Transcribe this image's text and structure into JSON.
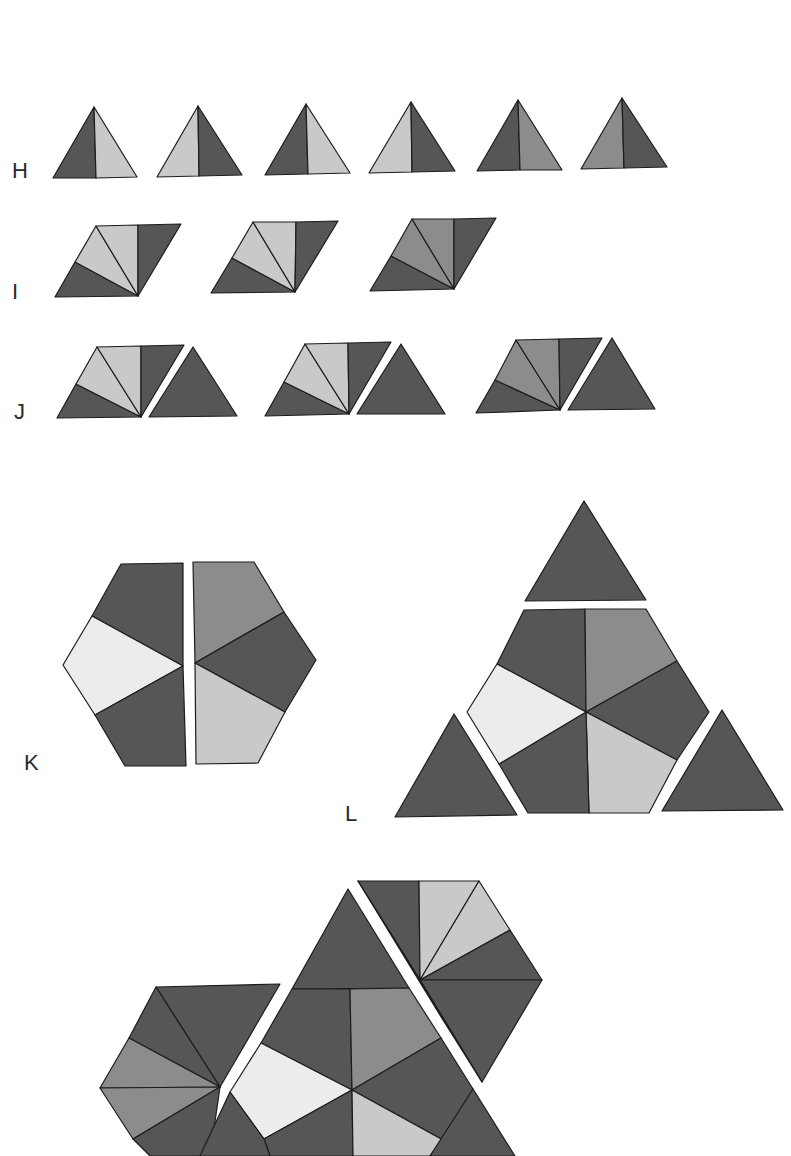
{
  "colors": {
    "dark": "#565656",
    "mid": "#8c8c8c",
    "light": "#c9c9c9",
    "pale": "#ececec",
    "stroke": "#1c1c1c"
  },
  "labels": [
    {
      "text": "H",
      "x": 12,
      "y": 160
    },
    {
      "text": "I",
      "x": 12,
      "y": 281
    },
    {
      "text": "J",
      "x": 14,
      "y": 401
    },
    {
      "text": "K",
      "x": 24,
      "y": 752
    },
    {
      "text": "L",
      "x": 345,
      "y": 803
    }
  ],
  "rows": {
    "H": {
      "label": "H",
      "shapes": [
        {
          "polys": [
            {
              "pts": "53,178 94,107 96,178",
              "fill": "dark"
            },
            {
              "pts": "94,107 96,178 137,177",
              "fill": "light"
            }
          ]
        },
        {
          "polys": [
            {
              "pts": "157,177 198,106 199,176",
              "fill": "light"
            },
            {
              "pts": "198,106 199,176 242,175",
              "fill": "dark"
            }
          ]
        },
        {
          "polys": [
            {
              "pts": "265,175 306,104 308,174",
              "fill": "dark"
            },
            {
              "pts": "306,104 308,174 350,173",
              "fill": "light"
            }
          ]
        },
        {
          "polys": [
            {
              "pts": "369,173 411,102 412,172",
              "fill": "light"
            },
            {
              "pts": "411,102 412,172 455,171",
              "fill": "dark"
            }
          ]
        },
        {
          "polys": [
            {
              "pts": "477,171 518,100 520,170",
              "fill": "dark"
            },
            {
              "pts": "518,100 520,170 562,170",
              "fill": "mid"
            }
          ]
        },
        {
          "polys": [
            {
              "pts": "581,169 622,98 624,168",
              "fill": "mid"
            },
            {
              "pts": "622,98 624,168 667,167",
              "fill": "dark"
            }
          ]
        }
      ]
    },
    "I": {
      "label": "I",
      "shapes": [
        {
          "polys": [
            {
              "pts": "55,297 75,262 138,296",
              "fill": "dark"
            },
            {
              "pts": "75,262 96,226 138,296",
              "fill": "light"
            },
            {
              "pts": "96,226 138,225 138,296",
              "fill": "light"
            },
            {
              "pts": "138,225 181,224 138,296",
              "fill": "dark"
            }
          ]
        },
        {
          "polys": [
            {
              "pts": "211,293 232,258 295,292",
              "fill": "dark"
            },
            {
              "pts": "232,258 253,222 295,292",
              "fill": "light"
            },
            {
              "pts": "253,222 296,222 295,292",
              "fill": "light"
            },
            {
              "pts": "296,222 338,221 295,292",
              "fill": "dark"
            }
          ]
        },
        {
          "polys": [
            {
              "pts": "370,291 391,256 454,289",
              "fill": "dark"
            },
            {
              "pts": "391,256 412,219 454,289",
              "fill": "mid"
            },
            {
              "pts": "412,219 454,219 454,289",
              "fill": "mid"
            },
            {
              "pts": "454,219 496,218 454,289",
              "fill": "dark"
            }
          ]
        }
      ]
    },
    "J": {
      "label": "J",
      "shapes": [
        {
          "polys": [
            {
              "pts": "57,418 76,384 141,417",
              "fill": "dark"
            },
            {
              "pts": "76,384 97,347 141,417",
              "fill": "light"
            },
            {
              "pts": "97,347 141,346 141,417",
              "fill": "light"
            },
            {
              "pts": "141,346 184,345 141,417",
              "fill": "dark"
            },
            {
              "pts": "149,417 193,347 237,416",
              "fill": "dark"
            }
          ]
        },
        {
          "polys": [
            {
              "pts": "265,416 284,382 349,414",
              "fill": "dark"
            },
            {
              "pts": "284,382 305,344 349,414",
              "fill": "light"
            },
            {
              "pts": "305,344 348,343 349,414",
              "fill": "light"
            },
            {
              "pts": "348,343 391,342 349,414",
              "fill": "dark"
            },
            {
              "pts": "357,414 401,344 445,414",
              "fill": "dark"
            }
          ]
        },
        {
          "polys": [
            {
              "pts": "476,413 495,380 560,410",
              "fill": "dark"
            },
            {
              "pts": "495,380 516,340 560,410",
              "fill": "mid"
            },
            {
              "pts": "516,340 559,339 560,410",
              "fill": "mid"
            },
            {
              "pts": "559,339 602,338 560,410",
              "fill": "dark"
            },
            {
              "pts": "568,410 612,338 655,409",
              "fill": "dark"
            }
          ]
        }
      ]
    },
    "K": {
      "label": "K",
      "shapes": [
        {
          "polys": [
            {
              "pts": "121,564 183,563 183,666 92,616",
              "fill": "dark"
            },
            {
              "pts": "92,616 183,666 95,715 63,665",
              "fill": "pale"
            },
            {
              "pts": "95,715 183,666 186,766 125,766",
              "fill": "dark"
            }
          ]
        },
        {
          "polys": [
            {
              "pts": "193,562 254,562 284,612 195,663",
              "fill": "mid"
            },
            {
              "pts": "284,612 316,660 285,712 195,663",
              "fill": "dark"
            },
            {
              "pts": "285,712 258,763 196,764 195,663",
              "fill": "light"
            }
          ]
        }
      ]
    },
    "L": {
      "label": "L",
      "shapes": [
        {
          "polys": [
            {
              "pts": "525,601 584,501 646,600",
              "fill": "dark"
            }
          ]
        },
        {
          "polys": [
            {
              "pts": "524,610 585,609 586,712 497,664",
              "fill": "dark"
            },
            {
              "pts": "585,609 646,609 677,661 586,712",
              "fill": "mid"
            },
            {
              "pts": "677,661 709,712 677,760 586,712",
              "fill": "dark"
            },
            {
              "pts": "677,760 649,813 589,813 586,712",
              "fill": "light"
            },
            {
              "pts": "586,712 589,813 528,813 499,764",
              "fill": "dark"
            },
            {
              "pts": "497,664 586,712 499,764 467,712",
              "fill": "pale"
            }
          ]
        },
        {
          "polys": [
            {
              "pts": "395,817 454,714 517,815",
              "fill": "dark"
            }
          ]
        },
        {
          "polys": [
            {
              "pts": "662,811 722,710 783,810",
              "fill": "dark"
            }
          ]
        }
      ]
    },
    "M": {
      "label": "",
      "shapes": [
        {
          "polys": [
            {
              "pts": "156,987 280,984 220,1087",
              "fill": "dark"
            },
            {
              "pts": "129,1038 156,987 220,1087",
              "fill": "dark"
            },
            {
              "pts": "100,1088 129,1038 220,1087",
              "fill": "mid"
            },
            {
              "pts": "100,1088 220,1087 133,1139",
              "fill": "mid"
            },
            {
              "pts": "133,1139 220,1087 210,1156 150,1156",
              "fill": "dark"
            }
          ]
        },
        {
          "polys": [
            {
              "pts": "292,989 348,889 409,988",
              "fill": "dark"
            },
            {
              "pts": "292,989 350,989 352,1090 261,1043",
              "fill": "dark"
            },
            {
              "pts": "350,989 409,988 441,1038 352,1090",
              "fill": "mid"
            },
            {
              "pts": "441,1038 473,1089 443,1140 352,1090",
              "fill": "dark"
            },
            {
              "pts": "261,1043 352,1090 264,1139 230,1092",
              "fill": "pale"
            },
            {
              "pts": "264,1139 352,1090 353,1156 270,1156",
              "fill": "dark"
            },
            {
              "pts": "352,1090 443,1140 430,1156 353,1156",
              "fill": "light"
            },
            {
              "pts": "230,1092 264,1139 270,1156 200,1156",
              "fill": "dark"
            },
            {
              "pts": "473,1089 515,1156 430,1156",
              "fill": "dark"
            }
          ]
        },
        {
          "polys": [
            {
              "pts": "358,881 419,881 420,980",
              "fill": "dark"
            },
            {
              "pts": "419,881 479,881 420,980",
              "fill": "light"
            },
            {
              "pts": "479,881 510,930 420,980",
              "fill": "light"
            },
            {
              "pts": "510,930 542,980 420,980",
              "fill": "dark"
            },
            {
              "pts": "420,980 542,980 482,1082",
              "fill": "dark"
            },
            {
              "pts": "358,881 420,980 482,1082 443,1020",
              "fill": "dark"
            }
          ]
        }
      ]
    }
  }
}
